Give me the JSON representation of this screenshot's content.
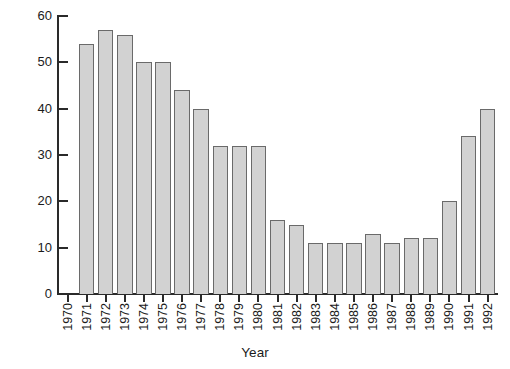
{
  "chart_data": {
    "type": "bar",
    "title": "",
    "xlabel": "Year",
    "ylabel": "",
    "categories": [
      "1970",
      "1971",
      "1972",
      "1973",
      "1974",
      "1975",
      "1976",
      "1977",
      "1978",
      "1979",
      "1980",
      "1981",
      "1982",
      "1983",
      "1984",
      "1985",
      "1986",
      "1987",
      "1988",
      "1989",
      "1990",
      "1991",
      "1992"
    ],
    "values": [
      0,
      54,
      57,
      56,
      50,
      50,
      44,
      40,
      32,
      32,
      32,
      16,
      15,
      11,
      11,
      11,
      13,
      11,
      12,
      12,
      20,
      34,
      40
    ],
    "ylim": [
      0,
      60
    ],
    "yticks": [
      0,
      10,
      20,
      30,
      40,
      50,
      60
    ],
    "ytick_labels": [
      "0",
      "10",
      "20",
      "30",
      "40",
      "50",
      "60"
    ],
    "grid": false,
    "legend": null,
    "bar_color": "#d2d2d2",
    "bar_edge_color": "#6a6a6a",
    "axis_color": "#2a2a2a",
    "background": "#ffffff"
  }
}
